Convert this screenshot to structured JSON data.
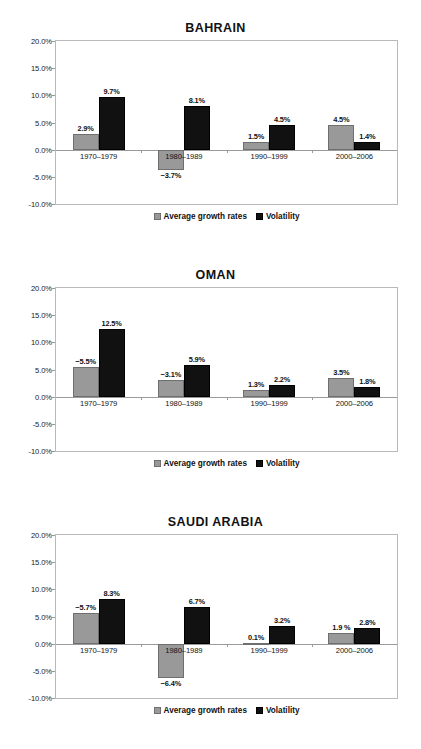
{
  "axis": {
    "yticks": [
      "20.0%",
      "15.0%",
      "10.0%",
      "5.0%",
      "0.0%",
      "-5.0%",
      "-10.0%"
    ],
    "ymin": -10,
    "ymax": 20
  },
  "legend": {
    "growth_label": "Average growth rates",
    "volatility_label": "Volatility"
  },
  "colors": {
    "growth": "#999999",
    "volatility": "#111111",
    "frame": "#b9b9b9",
    "baseline": "#9a9a9a"
  },
  "chart_data": [
    {
      "type": "bar",
      "title": "BAHRAIN",
      "xlabel": "",
      "ylabel": "",
      "ylim": [
        -10,
        20
      ],
      "grid": false,
      "legend_position": "bottom",
      "categories": [
        "1970–1979",
        "1980–1989",
        "1990–1999",
        "2000–2006"
      ],
      "series": [
        {
          "name": "Average growth rates",
          "values": [
            2.9,
            -3.7,
            1.5,
            4.5
          ],
          "labels": [
            "2.9%",
            "−3.7%",
            "1.5%",
            "4.5%"
          ]
        },
        {
          "name": "Volatility",
          "values": [
            9.7,
            8.1,
            4.5,
            1.4
          ],
          "labels": [
            "9.7%",
            "8.1%",
            "4.5%",
            "1.4%"
          ]
        }
      ]
    },
    {
      "type": "bar",
      "title": "OMAN",
      "xlabel": "",
      "ylabel": "",
      "ylim": [
        -10,
        20
      ],
      "grid": false,
      "legend_position": "bottom",
      "categories": [
        "1970–1979",
        "1980–1989",
        "1990–1999",
        "2000–2006"
      ],
      "series": [
        {
          "name": "Average growth rates",
          "values": [
            5.5,
            3.1,
            1.3,
            3.5
          ],
          "labels": [
            "−5.5%",
            "−3.1%",
            "1.3%",
            "3.5%"
          ]
        },
        {
          "name": "Volatility",
          "values": [
            12.5,
            5.9,
            2.2,
            1.8
          ],
          "labels": [
            "12.5%",
            "5.9%",
            "2.2%",
            "1.8%"
          ]
        }
      ]
    },
    {
      "type": "bar",
      "title": "SAUDI ARABIA",
      "xlabel": "",
      "ylabel": "",
      "ylim": [
        -10,
        20
      ],
      "grid": false,
      "legend_position": "bottom",
      "categories": [
        "1970–1979",
        "1980–1989",
        "1990–1999",
        "2000–2006"
      ],
      "series": [
        {
          "name": "Average growth rates",
          "values": [
            5.7,
            -6.4,
            0.1,
            1.9
          ],
          "labels": [
            "−5.7%",
            "−6.4%",
            "0.1%",
            "1.9 %"
          ]
        },
        {
          "name": "Volatility",
          "values": [
            8.3,
            6.7,
            3.2,
            2.8
          ],
          "labels": [
            "8.3%",
            "6.7%",
            "3.2%",
            "2.8%"
          ]
        }
      ]
    }
  ]
}
